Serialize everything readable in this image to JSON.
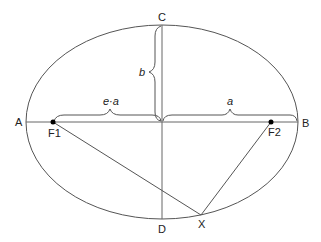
{
  "diagram": {
    "points": {
      "A": "A",
      "B": "B",
      "C": "C",
      "D": "D",
      "F1": "F1",
      "F2": "F2",
      "X": "X"
    },
    "brace_labels": {
      "b": "b",
      "ea": "e·a",
      "a": "a"
    },
    "colors": {
      "stroke": "#555555",
      "text": "#222222",
      "focus": "#000000"
    }
  }
}
